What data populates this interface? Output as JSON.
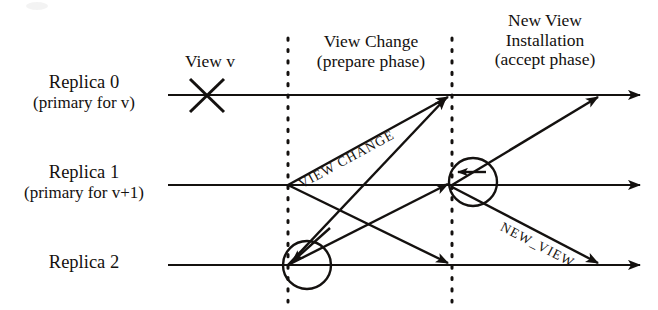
{
  "figure": {
    "ink_color": "#14110f",
    "background_color": "#ffffff"
  },
  "replicas": [
    {
      "id": "replica-0",
      "name": "Replica 0",
      "role": "(primary for v)",
      "timeline_y": 95
    },
    {
      "id": "replica-1",
      "name": "Replica 1",
      "role": "(primary for v+1)",
      "timeline_y": 185
    },
    {
      "id": "replica-2",
      "name": "Replica 2",
      "role": "",
      "timeline_y": 265
    }
  ],
  "phases": [
    {
      "id": "view-change-phase",
      "name": "View Change",
      "sub": "(prepare phase)",
      "boundary_left_x": 288,
      "boundary_right_x": 452
    },
    {
      "id": "new-view-phase",
      "name": "New View",
      "sub": "Installation",
      "sub2": "(accept phase)",
      "boundary_left_x": 452
    }
  ],
  "markers": [
    {
      "id": "failure-marker",
      "glyph": "X",
      "label": "View v",
      "x": 207,
      "y": 95
    }
  ],
  "messages": [
    {
      "id": "view-change-message",
      "label": "VIEW CHANGE",
      "from": "replica-1",
      "to": "replica-0"
    },
    {
      "id": "new-view-message",
      "label": "NEW_VIEW",
      "from": "replica-1",
      "to": "replica-2"
    }
  ],
  "dividers": {
    "first_x": 288,
    "second_x": 452,
    "top_y": 38,
    "bottom_y": 300
  }
}
